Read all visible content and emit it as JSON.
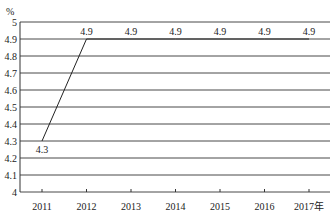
{
  "chart_data": {
    "type": "line",
    "title": "",
    "xlabel": "",
    "ylabel": "%",
    "x_unit_suffix": "年",
    "categories": [
      "2011",
      "2012",
      "2013",
      "2014",
      "2015",
      "2016",
      "2017年"
    ],
    "series": [
      {
        "name": "rate",
        "values": [
          4.3,
          4.9,
          4.9,
          4.9,
          4.9,
          4.9,
          4.9
        ]
      }
    ],
    "data_labels": [
      "4.3",
      "4.9",
      "4.9",
      "4.9",
      "4.9",
      "4.9",
      "4.9"
    ],
    "ylim": [
      4,
      5
    ],
    "yticks": [
      "4",
      "4.1",
      "4.2",
      "4.3",
      "4.4",
      "4.5",
      "4.6",
      "4.7",
      "4.8",
      "4.9",
      "5"
    ],
    "grid": true,
    "legend": "none"
  },
  "colors": {
    "line": "#222222",
    "grid": "#333333",
    "text": "#222222"
  }
}
